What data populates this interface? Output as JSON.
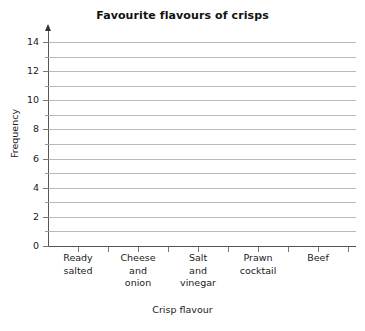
{
  "top_sliver": {
    "text": "·· ·      ·"
  },
  "chart_data": {
    "type": "bar",
    "title": "Favourite flavours of crisps",
    "xlabel": "Crisp flavour",
    "ylabel": "Frequency",
    "categories": [
      "Ready salted",
      "Cheese and onion",
      "Salt and vinegar",
      "Prawn cocktail",
      "Beef"
    ],
    "category_lines": [
      [
        "Ready",
        "salted"
      ],
      [
        "Cheese",
        "and",
        "onion"
      ],
      [
        "Salt",
        "and",
        "vinegar"
      ],
      [
        "Prawn",
        "cocktail"
      ],
      [
        "Beef"
      ]
    ],
    "values": [
      null,
      null,
      null,
      null,
      null
    ],
    "ylim": [
      0,
      14
    ],
    "y_major_ticks": [
      0,
      2,
      4,
      6,
      8,
      10,
      12,
      14
    ],
    "y_minor_ticks": [
      1,
      3,
      5,
      7,
      9,
      11,
      13
    ],
    "y_tick_labels": [
      "0",
      "2",
      "4",
      "6",
      "8",
      "10",
      "12",
      "14"
    ],
    "gridlines": [
      1,
      2,
      3,
      4,
      5,
      6,
      7,
      8,
      9,
      10,
      11,
      12,
      13,
      14
    ],
    "grid": true,
    "legend": false,
    "legend_position": "none",
    "note": "Blank grid template: axes and gridlines drawn, no bars plotted",
    "colors": {
      "gridline": "#b9b9b9",
      "axis": "#555555",
      "text": "#1a1a1a",
      "background": "#ffffff"
    }
  }
}
